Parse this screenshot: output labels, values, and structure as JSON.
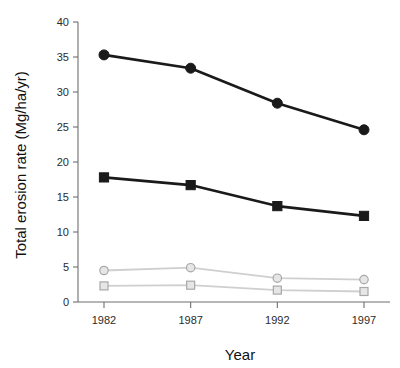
{
  "chart_data": {
    "type": "line",
    "title": "",
    "xlabel": "Year",
    "ylabel": "Total erosion rate (Mg/ha/yr)",
    "categories": [
      "1982",
      "1987",
      "1992",
      "1997"
    ],
    "x": [
      1982,
      1987,
      1992,
      1997
    ],
    "xlim": [
      1980.5,
      1998.5
    ],
    "ylim": [
      0,
      40
    ],
    "yticks": [
      0,
      5,
      10,
      15,
      20,
      25,
      30,
      35,
      40
    ],
    "ytick_labels": [
      "0",
      "5",
      "10",
      "15",
      "20",
      "25",
      "30",
      "35",
      "40"
    ],
    "xtick_labels": [
      "1982",
      "1987",
      "1992",
      "1997"
    ],
    "grid": false,
    "legend": "none",
    "series": [
      {
        "name": "dark-circles",
        "marker": "circle",
        "color": "#1a1a1a",
        "values": [
          35.3,
          33.4,
          28.4,
          24.6
        ]
      },
      {
        "name": "dark-squares",
        "marker": "square",
        "color": "#1a1a1a",
        "values": [
          17.8,
          16.7,
          13.7,
          12.3
        ]
      },
      {
        "name": "light-circles",
        "marker": "circle",
        "color": "#cfcfcf",
        "values": [
          4.5,
          4.9,
          3.4,
          3.2
        ]
      },
      {
        "name": "light-squares",
        "marker": "square",
        "color": "#cfcfcf",
        "values": [
          2.3,
          2.4,
          1.7,
          1.5
        ]
      }
    ]
  },
  "axes": {
    "y_title": "Total erosion rate (Mg/ha/yr)",
    "x_title": "Year"
  },
  "colors": {
    "dark_series": "#1a1a1a",
    "light_series": "#cfcfcf",
    "axis": "#6e6e6e",
    "background": "#ffffff"
  }
}
